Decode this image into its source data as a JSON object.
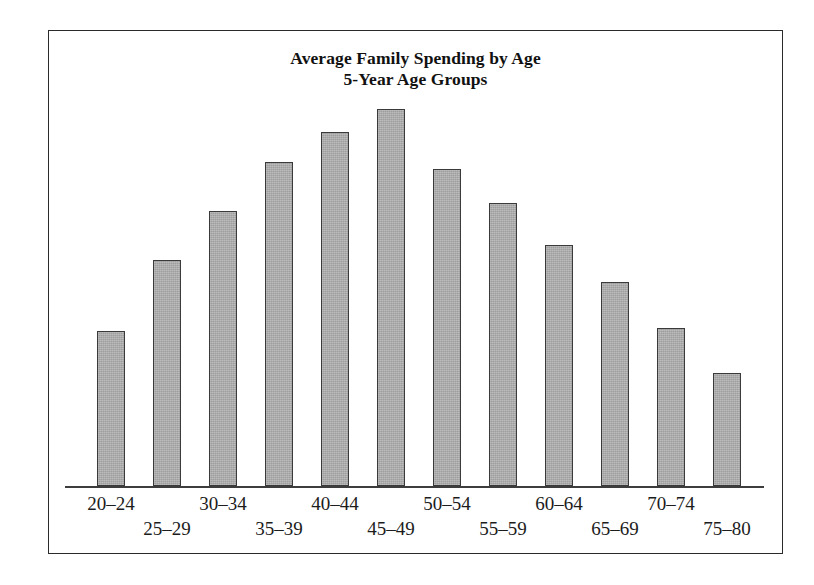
{
  "figure": {
    "title_lines": [
      "Average Family Spending by Age",
      "5-Year Age Groups"
    ],
    "bar_fill_color": "#a9a9a9",
    "bar_edge_color": "#3a3a3a",
    "frame_color": "#2b2b2b",
    "axis_color": "#3d3d3d"
  },
  "chart_data": {
    "type": "bar",
    "title": "Average Family Spending by Age\n5-Year Age Groups",
    "xlabel": "",
    "ylabel": "",
    "ylim": [
      0,
      100
    ],
    "grid": false,
    "legend": false,
    "axis": {
      "y_axis_visible": false,
      "y_tick_labels": [],
      "x_axis_visible": true,
      "x_tick_label_style": "staggered-two-rows"
    },
    "categories": [
      "20–24",
      "25–29",
      "30–34",
      "35–39",
      "40–44",
      "45–49",
      "50–54",
      "55–59",
      "60–64",
      "65–69",
      "70–74",
      "75–80"
    ],
    "values": [
      41,
      60,
      73,
      86,
      94,
      100,
      84,
      75,
      64,
      54,
      42,
      30
    ]
  }
}
